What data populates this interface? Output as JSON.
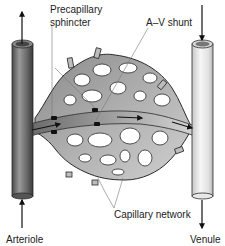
{
  "diagram": {
    "labels": {
      "precapillary_line1": "Precapillary",
      "precapillary_line2": "sphincter",
      "av_shunt": "A–V shunt",
      "capillary_network": "Capillary network",
      "arteriole": "Arteriole",
      "venule": "Venule"
    },
    "colors": {
      "arteriole": "#6e6e6e",
      "venule": "#e6e6e6",
      "capillary": "#a9a9a9",
      "outline": "#2a2a2a",
      "sphincter": "#111111",
      "arrow": "#111111",
      "leader_line": "#666666"
    },
    "flow": {
      "arteriole_in": "up",
      "arteriole_top": "up",
      "venule_top": "down",
      "venule_out": "down",
      "shunt": "left-to-right"
    }
  }
}
